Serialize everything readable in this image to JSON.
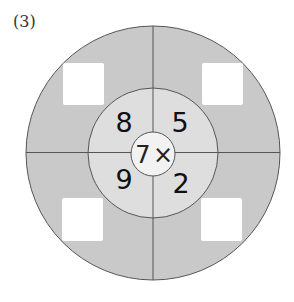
{
  "problem_label": "(3)",
  "center": {
    "multiplier": "7",
    "operator": "×"
  },
  "numbers": {
    "top_left": "8",
    "top_right": "5",
    "bottom_left": "9",
    "bottom_right": "2"
  },
  "answer_boxes": [
    "",
    "",
    "",
    ""
  ],
  "colors": {
    "outer_ring": "#c9c9c9",
    "middle_ring": "#dedede",
    "inner_circle": "#f2f2f2",
    "lines": "#555555",
    "answer_box": "#ffffff"
  }
}
